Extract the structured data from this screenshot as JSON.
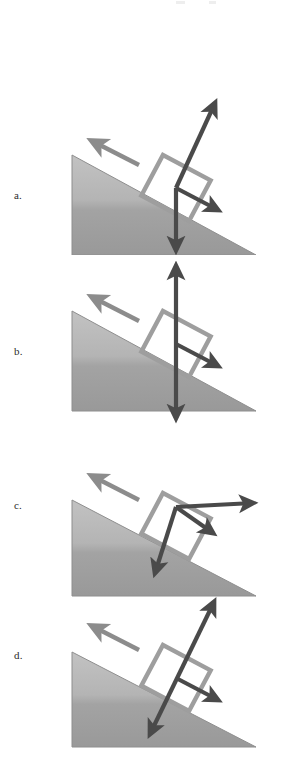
{
  "figure": {
    "background_color": "#ffffff",
    "incline_fill_top": "#b9b9b9",
    "incline_fill_bottom": "#9a9a9a",
    "incline_edge_color": "#8e8e8e",
    "block_outline_color": "#9e9e9e",
    "force_arrow_color": "#4a4a4a",
    "velocity_arrow_color": "#8c8c8c"
  },
  "panels": [
    {
      "id": "a",
      "label": "a.",
      "incline": {
        "apex_x": 72,
        "apex_y": 75,
        "bottom_left_x": 72,
        "bottom_left_y": 175,
        "bottom_right_x": 256,
        "bottom_right_y": 175,
        "slope_angle_deg": 28
      },
      "velocity_arrow": {
        "name": "velocity-arrow",
        "direction": "up-the-incline",
        "from_x": 139,
        "from_y": 85,
        "to_x": 92,
        "to_y": 61
      },
      "block": {
        "name": "block-outline",
        "center_x": 176,
        "center_y": 108,
        "width": 54,
        "height": 46,
        "rotation_deg": 28
      },
      "force_vectors": [
        {
          "name": "normal-force-arrow",
          "label": "up-right long arrow",
          "from_x": 176,
          "from_y": 108,
          "to_x": 215,
          "to_y": 23,
          "double_headed": false
        },
        {
          "name": "friction-force-arrow",
          "label": "down-slope arrow",
          "from_x": 176,
          "from_y": 108,
          "to_x": 218,
          "to_y": 130,
          "double_headed": false
        },
        {
          "name": "gravity-force-arrow",
          "label": "straight down arrow",
          "from_x": 176,
          "from_y": 108,
          "to_x": 176,
          "to_y": 170,
          "double_headed": false
        }
      ]
    },
    {
      "id": "b",
      "label": "b.",
      "incline": {
        "apex_x": 72,
        "apex_y": 53,
        "bottom_left_x": 72,
        "bottom_left_y": 153,
        "bottom_right_x": 256,
        "bottom_right_y": 153,
        "slope_angle_deg": 28
      },
      "velocity_arrow": {
        "name": "velocity-arrow",
        "direction": "up-the-incline",
        "from_x": 139,
        "from_y": 63,
        "to_x": 92,
        "to_y": 39
      },
      "block": {
        "name": "block-outline",
        "center_x": 176,
        "center_y": 86,
        "width": 54,
        "height": 46,
        "rotation_deg": 28
      },
      "force_vectors": [
        {
          "name": "vertical-double-arrow",
          "label": "vertical double-headed arrow",
          "from_x": 176,
          "from_y": 8,
          "to_x": 176,
          "to_y": 160,
          "double_headed": true
        },
        {
          "name": "friction-force-arrow",
          "label": "down-slope arrow",
          "from_x": 176,
          "from_y": 86,
          "to_x": 218,
          "to_y": 108,
          "double_headed": false
        }
      ]
    },
    {
      "id": "c",
      "label": "c.",
      "incline": {
        "apex_x": 72,
        "apex_y": 72,
        "bottom_left_x": 72,
        "bottom_left_y": 168,
        "bottom_right_x": 256,
        "bottom_right_y": 168,
        "slope_angle_deg": 28
      },
      "velocity_arrow": {
        "name": "velocity-arrow",
        "direction": "up-the-incline",
        "from_x": 139,
        "from_y": 72,
        "to_x": 92,
        "to_y": 48
      },
      "block": {
        "name": "block-outline",
        "center_x": 176,
        "center_y": 98,
        "width": 54,
        "height": 46,
        "rotation_deg": 28
      },
      "force_vectors": [
        {
          "name": "horizontal-force-arrow",
          "label": "horizontal right arrow",
          "from_x": 176,
          "from_y": 79,
          "to_x": 253,
          "to_y": 75,
          "double_headed": false
        },
        {
          "name": "friction-force-arrow",
          "label": "down-slope arrow",
          "from_x": 176,
          "from_y": 79,
          "to_x": 213,
          "to_y": 105,
          "double_headed": false
        },
        {
          "name": "gravity-force-arrow",
          "label": "down-left steep arrow",
          "from_x": 176,
          "from_y": 79,
          "to_x": 155,
          "to_y": 145,
          "double_headed": false
        }
      ]
    },
    {
      "id": "d",
      "label": "d.",
      "incline": {
        "apex_x": 72,
        "apex_y": 60,
        "bottom_left_x": 72,
        "bottom_left_y": 155,
        "bottom_right_x": 256,
        "bottom_right_y": 155,
        "slope_angle_deg": 28
      },
      "velocity_arrow": {
        "name": "velocity-arrow",
        "direction": "up-the-incline",
        "from_x": 139,
        "from_y": 58,
        "to_x": 92,
        "to_y": 34
      },
      "block": {
        "name": "block-outline",
        "center_x": 176,
        "center_y": 86,
        "width": 54,
        "height": 46,
        "rotation_deg": 28
      },
      "force_vectors": [
        {
          "name": "normal-double-arrow",
          "label": "perpendicular double-headed arrow",
          "from_x": 214,
          "from_y": 10,
          "to_x": 150,
          "to_y": 142,
          "double_headed": true
        },
        {
          "name": "friction-force-arrow",
          "label": "down-slope arrow",
          "from_x": 176,
          "from_y": 86,
          "to_x": 218,
          "to_y": 108,
          "double_headed": false
        }
      ]
    }
  ]
}
